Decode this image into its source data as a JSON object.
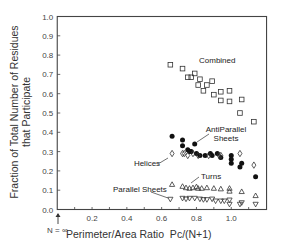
{
  "chart_data": {
    "type": "scatter",
    "title": "",
    "xlabel": "Perimeter/Area Ratio  Pc/(N+1)",
    "ylabel": [
      "Fraction of Total Number of Residues",
      "that Participate"
    ],
    "xlim": [
      0,
      1.2
    ],
    "ylim": [
      0,
      1.0
    ],
    "x_ticks": [
      0.2,
      0.4,
      0.6,
      0.8,
      1.0
    ],
    "x_tick_labels": [
      "0.2",
      "0.4",
      "0.6",
      "0.8",
      "1.0"
    ],
    "y_ticks": [
      0.0,
      0.1,
      0.2,
      0.3,
      0.4,
      0.5,
      0.6,
      0.7,
      0.8,
      0.9,
      1.0
    ],
    "y_tick_labels": [
      "0.0",
      "0.1",
      "0.2",
      "0.3",
      "0.4",
      "0.5",
      "0.6",
      "0.7",
      "0.8",
      "0.9",
      "1.0"
    ],
    "grid": false,
    "legend": "inline annotations",
    "x_annotation": "N = ∞",
    "series": [
      {
        "name": "Combined",
        "marker": "open-square",
        "label_pos": [
          0.78,
          0.78
        ],
        "points": [
          [
            0.65,
            0.75
          ],
          [
            0.72,
            0.73
          ],
          [
            0.75,
            0.685
          ],
          [
            0.77,
            0.685
          ],
          [
            0.79,
            0.705
          ],
          [
            0.82,
            0.675
          ],
          [
            0.81,
            0.645
          ],
          [
            0.86,
            0.645
          ],
          [
            0.89,
            0.665
          ],
          [
            0.84,
            0.615
          ],
          [
            0.9,
            0.595
          ],
          [
            0.94,
            0.61
          ],
          [
            0.99,
            0.615
          ],
          [
            0.94,
            0.565
          ],
          [
            0.99,
            0.56
          ],
          [
            1.06,
            0.57
          ],
          [
            1.05,
            0.5
          ],
          [
            1.13,
            0.455
          ]
        ]
      },
      {
        "name": "AntiParallel Sheets",
        "marker": "filled-circle",
        "label_pos": [
          0.97,
          0.41
        ],
        "points": [
          [
            0.66,
            0.38
          ],
          [
            0.72,
            0.36
          ],
          [
            0.79,
            0.34
          ],
          [
            0.72,
            0.33
          ],
          [
            0.75,
            0.31
          ],
          [
            0.77,
            0.3
          ],
          [
            0.76,
            0.3
          ],
          [
            0.8,
            0.29
          ],
          [
            0.82,
            0.28
          ],
          [
            0.85,
            0.28
          ],
          [
            0.88,
            0.29
          ],
          [
            0.89,
            0.28
          ],
          [
            0.92,
            0.29
          ],
          [
            0.94,
            0.27
          ],
          [
            1.0,
            0.28
          ],
          [
            1.0,
            0.26
          ],
          [
            1.0,
            0.24
          ],
          [
            1.06,
            0.24
          ],
          [
            1.05,
            0.22
          ],
          [
            1.14,
            0.17
          ]
        ]
      },
      {
        "name": "Helices",
        "marker": "open-diamond",
        "label_pos": [
          0.53,
          0.24
        ],
        "points": [
          [
            0.66,
            0.29
          ],
          [
            0.72,
            0.29
          ],
          [
            0.73,
            0.29
          ],
          [
            0.75,
            0.28
          ],
          [
            0.78,
            0.29
          ],
          [
            0.81,
            0.28
          ],
          [
            0.87,
            0.28
          ],
          [
            0.93,
            0.28
          ],
          [
            0.94,
            0.28
          ],
          [
            1.05,
            0.29
          ],
          [
            1.13,
            0.23
          ]
        ]
      },
      {
        "name": "Turns",
        "marker": "open-triangle-up",
        "label_pos": [
          0.83,
          0.165
        ],
        "points": [
          [
            0.66,
            0.13
          ],
          [
            0.72,
            0.12
          ],
          [
            0.74,
            0.113
          ],
          [
            0.76,
            0.11
          ],
          [
            0.78,
            0.113
          ],
          [
            0.8,
            0.118
          ],
          [
            0.81,
            0.11
          ],
          [
            0.83,
            0.11
          ],
          [
            0.86,
            0.113
          ],
          [
            0.9,
            0.11
          ],
          [
            0.94,
            0.107
          ],
          [
            0.99,
            0.11
          ],
          [
            0.99,
            0.095
          ],
          [
            1.06,
            0.093
          ],
          [
            1.14,
            0.072
          ]
        ]
      },
      {
        "name": "Parallel Sheets",
        "marker": "open-triangle-down",
        "label_pos": [
          0.32,
          0.1
        ],
        "points": [
          [
            0.65,
            0.053
          ],
          [
            0.72,
            0.058
          ],
          [
            0.74,
            0.054
          ],
          [
            0.76,
            0.058
          ],
          [
            0.79,
            0.058
          ],
          [
            0.82,
            0.054
          ],
          [
            0.84,
            0.051
          ],
          [
            0.86,
            0.051
          ],
          [
            0.89,
            0.054
          ],
          [
            0.91,
            0.044
          ],
          [
            0.94,
            0.044
          ],
          [
            0.96,
            0.044
          ],
          [
            0.99,
            0.049
          ],
          [
            0.99,
            0.027
          ],
          [
            1.05,
            0.027
          ],
          [
            1.06,
            0.035
          ],
          [
            1.14,
            0.027
          ]
        ]
      }
    ]
  }
}
